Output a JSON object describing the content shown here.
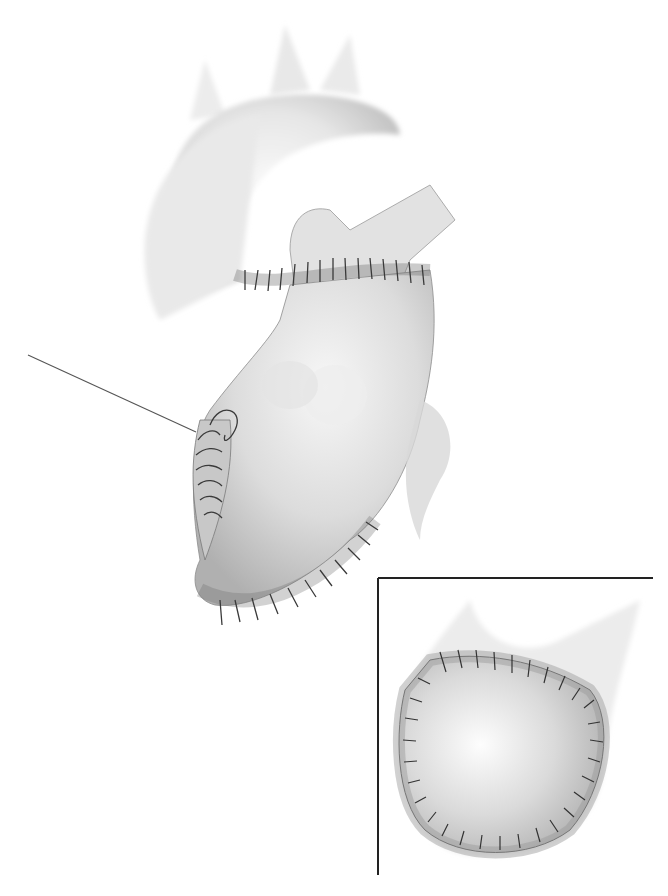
{
  "figure": {
    "main_view": {
      "subject": "heart-with-aortic-graft",
      "annotations": [
        "leader-line-to-suture-site"
      ]
    },
    "inset_view": {
      "subject": "sutured-patch-closeup"
    },
    "colors": {
      "background": "#ffffff",
      "tissue_light": "#f2f2f2",
      "tissue_mid": "#d4d4d4",
      "tissue_shadow": "#a8a8a8",
      "suture": "#3a3a3a",
      "frame": "#222222"
    }
  }
}
